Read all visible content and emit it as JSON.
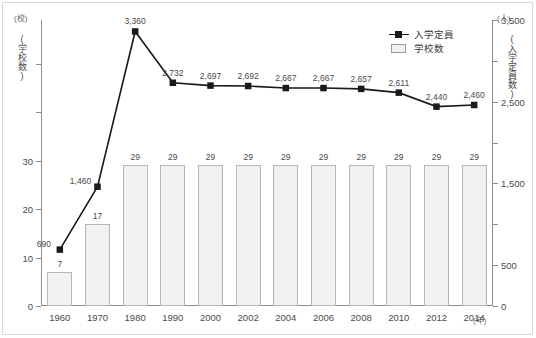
{
  "chart_data": {
    "type": "bar",
    "title": "",
    "categories": [
      "1960",
      "1970",
      "1980",
      "1990",
      "2000",
      "2002",
      "2004",
      "2006",
      "2008",
      "2010",
      "2012",
      "2014"
    ],
    "xlabel": "(年)",
    "series": [
      {
        "name": "学校数",
        "type": "bar",
        "axis": "left",
        "unit": "(校)",
        "axis_title": "(学校数)",
        "values": [
          7,
          17,
          29,
          29,
          29,
          29,
          29,
          29,
          29,
          29,
          29,
          29
        ],
        "labels": [
          "7",
          "17",
          "29",
          "29",
          "29",
          "29",
          "29",
          "29",
          "29",
          "29",
          "29",
          "29"
        ],
        "ylim": [
          0,
          59
        ],
        "ticks": [
          0,
          10,
          20,
          30,
          40,
          50
        ],
        "tick_labels": [
          "0",
          "10",
          "20",
          "30",
          "",
          ""
        ],
        "fill_color": "#f1f1f1",
        "border_color": "#b6b6b6"
      },
      {
        "name": "入学定員",
        "type": "line",
        "axis": "right",
        "unit": "(人)",
        "axis_title": "(入学定員数)",
        "values": [
          690,
          1460,
          3360,
          2732,
          2697,
          2692,
          2667,
          2667,
          2657,
          2611,
          2440,
          2460
        ],
        "labels": [
          "690",
          "1,460",
          "3,360",
          "2,732",
          "2,697",
          "2,692",
          "2,667",
          "2,667",
          "2,657",
          "2,611",
          "2,440",
          "2,460"
        ],
        "ylim": [
          0,
          3500
        ],
        "ticks": [
          0,
          500,
          1000,
          1500,
          2000,
          2500,
          3000,
          3500
        ],
        "tick_labels": [
          "0",
          "500",
          "",
          "1,500",
          "",
          "2,500",
          "",
          "3,500"
        ],
        "line_color": "#1a1a1a",
        "marker": "square"
      }
    ],
    "legend": {
      "position": "top-right",
      "entries": [
        {
          "label": "入学定員",
          "key": "line-marker"
        },
        {
          "label": "学校数",
          "key": "box"
        }
      ]
    },
    "grid": false
  }
}
